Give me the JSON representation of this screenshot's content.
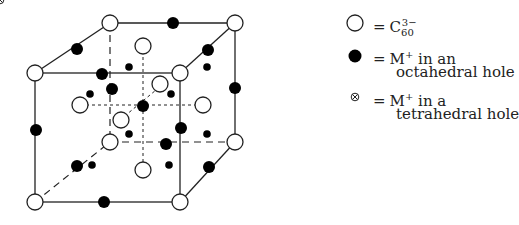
{
  "legend": {
    "items": [
      {
        "symbol": "open-circle",
        "eq": "=",
        "text": "C",
        "sub": "60",
        "sup": "3−"
      },
      {
        "symbol": "filled-circle",
        "eq": "=",
        "line1": "M",
        "sup": "+",
        "line1_rest": " in an",
        "line2": "octahedral hole"
      },
      {
        "symbol": "crossed-circle",
        "eq": "=",
        "line1": "M",
        "sup": "+",
        "line1_rest": " in a",
        "line2": "tetrahedral hole"
      }
    ]
  }
}
